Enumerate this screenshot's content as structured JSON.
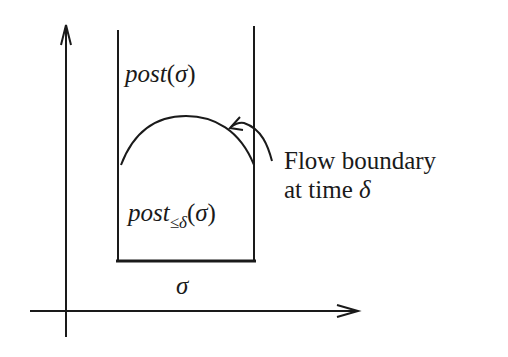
{
  "diagram": {
    "labels": {
      "post_sigma": {
        "fn": "post",
        "open": "(",
        "arg": "σ",
        "close": ")"
      },
      "post_le_delta": {
        "fn": "post",
        "sub": "≤δ",
        "open": "(",
        "arg": "σ",
        "close": ")"
      },
      "sigma": "σ",
      "annotation": {
        "line1": "Flow boundary",
        "line2_text": "at time ",
        "line2_sym": "δ"
      }
    },
    "colors": {
      "ink": "#1a1a1a",
      "background": "#ffffff"
    }
  }
}
